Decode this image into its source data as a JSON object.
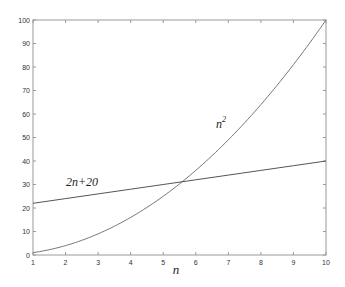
{
  "chart_data": {
    "type": "line",
    "title": "",
    "xlabel": "n",
    "ylabel": "",
    "xlim": [
      1,
      10
    ],
    "ylim": [
      0,
      100
    ],
    "grid": false,
    "legend": "none (inline curve labels)",
    "x_ticks": [
      "1",
      "2",
      "3",
      "4",
      "5",
      "6",
      "7",
      "8",
      "9",
      "10"
    ],
    "y_ticks": [
      "0",
      "10",
      "20",
      "30",
      "40",
      "50",
      "60",
      "70",
      "80",
      "90",
      "100"
    ],
    "x": [
      1,
      2,
      3,
      4,
      5,
      6,
      7,
      8,
      9,
      10
    ],
    "series": [
      {
        "name": "n^2",
        "label": "n",
        "label_sup": "2",
        "values": [
          1,
          4,
          9,
          16,
          25,
          36,
          49,
          64,
          81,
          100
        ]
      },
      {
        "name": "2n+20",
        "label": "2n+20",
        "values": [
          22,
          24,
          26,
          28,
          30,
          32,
          34,
          36,
          38,
          40
        ]
      }
    ],
    "annotations": [
      {
        "text": "n^2",
        "near": [
          6.9,
          45
        ]
      },
      {
        "text": "2n+20",
        "near": [
          2.0,
          28
        ]
      }
    ],
    "intersection": {
      "n": 5.58,
      "value": 31.2
    }
  }
}
